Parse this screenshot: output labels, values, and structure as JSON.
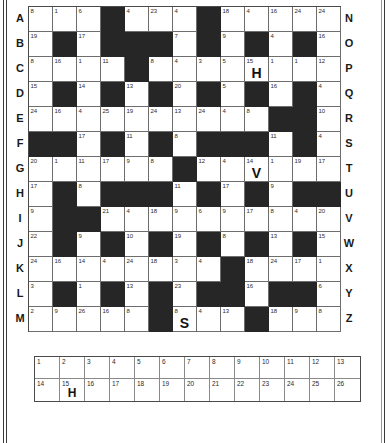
{
  "puzzle": {
    "type": "codeword",
    "grid_columns": 13,
    "grid_rows": 13,
    "row_labels_left": [
      "A",
      "B",
      "C",
      "D",
      "E",
      "F",
      "G",
      "H",
      "I",
      "J",
      "K",
      "L",
      "M"
    ],
    "row_labels_right": [
      "N",
      "O",
      "P",
      "Q",
      "R",
      "S",
      "T",
      "U",
      "V",
      "W",
      "X",
      "Y",
      "Z"
    ],
    "rows": [
      [
        {
          "n": "8"
        },
        {
          "n": "1"
        },
        {
          "n": "6"
        },
        {
          "black": true
        },
        {
          "n": "4"
        },
        {
          "n": "23"
        },
        {
          "n": "4"
        },
        {
          "black": true
        },
        {
          "n": "18"
        },
        {
          "n": "4"
        },
        {
          "n": "16"
        },
        {
          "n": "24"
        },
        {
          "n": "24"
        }
      ],
      [
        {
          "n": "19"
        },
        {
          "black": true
        },
        {
          "n": "17"
        },
        {
          "black": true
        },
        {
          "black": true
        },
        {
          "black": true
        },
        {
          "n": "7"
        },
        {
          "black": true
        },
        {
          "n": "9"
        },
        {
          "black": true
        },
        {
          "n": "4"
        },
        {
          "black": true
        },
        {
          "n": "16"
        }
      ],
      [
        {
          "n": "8"
        },
        {
          "n": "16"
        },
        {
          "n": "1"
        },
        {
          "n": "11"
        },
        {
          "black": true
        },
        {
          "n": "8"
        },
        {
          "n": "4"
        },
        {
          "n": "3"
        },
        {
          "n": "5"
        },
        {
          "n": "15",
          "letter": "H"
        },
        {
          "n": "1"
        },
        {
          "n": "1"
        },
        {
          "n": "12"
        }
      ],
      [
        {
          "n": "15"
        },
        {
          "black": true
        },
        {
          "n": "14"
        },
        {
          "black": true
        },
        {
          "n": "13"
        },
        {
          "black": true
        },
        {
          "n": "20"
        },
        {
          "black": true
        },
        {
          "n": "5"
        },
        {
          "black": true
        },
        {
          "n": "16"
        },
        {
          "black": true
        },
        {
          "n": "4"
        }
      ],
      [
        {
          "n": "24"
        },
        {
          "n": "16"
        },
        {
          "n": "4"
        },
        {
          "n": "25"
        },
        {
          "n": "19"
        },
        {
          "n": "24"
        },
        {
          "n": "13"
        },
        {
          "n": "24"
        },
        {
          "n": "4"
        },
        {
          "n": "8"
        },
        {
          "black": true
        },
        {
          "black": true
        },
        {
          "n": "10"
        }
      ],
      [
        {
          "black": true
        },
        {
          "black": true
        },
        {
          "n": "17"
        },
        {
          "black": true
        },
        {
          "n": "11"
        },
        {
          "black": true
        },
        {
          "n": "8"
        },
        {
          "black": true
        },
        {
          "black": true
        },
        {
          "black": true
        },
        {
          "n": "11"
        },
        {
          "black": true
        },
        {
          "n": "4"
        }
      ],
      [
        {
          "n": "20"
        },
        {
          "n": "1"
        },
        {
          "n": "11"
        },
        {
          "n": "17"
        },
        {
          "n": "9"
        },
        {
          "n": "8"
        },
        {
          "black": true
        },
        {
          "n": "12"
        },
        {
          "n": "4"
        },
        {
          "n": "14",
          "letter": "V"
        },
        {
          "n": "1"
        },
        {
          "n": "19"
        },
        {
          "n": "17"
        }
      ],
      [
        {
          "n": "17"
        },
        {
          "black": true
        },
        {
          "n": "8"
        },
        {
          "black": true
        },
        {
          "black": true
        },
        {
          "black": true
        },
        {
          "n": "11"
        },
        {
          "black": true
        },
        {
          "n": "17"
        },
        {
          "black": true
        },
        {
          "n": "9"
        },
        {
          "black": true
        },
        {
          "black": true
        }
      ],
      [
        {
          "n": "9"
        },
        {
          "black": true
        },
        {
          "black": true
        },
        {
          "n": "21"
        },
        {
          "n": "4"
        },
        {
          "n": "18"
        },
        {
          "n": "9"
        },
        {
          "n": "6"
        },
        {
          "n": "9"
        },
        {
          "n": "17"
        },
        {
          "n": "8"
        },
        {
          "n": "4"
        },
        {
          "n": "20"
        }
      ],
      [
        {
          "n": "22"
        },
        {
          "black": true
        },
        {
          "n": "9"
        },
        {
          "black": true
        },
        {
          "n": "10"
        },
        {
          "black": true
        },
        {
          "n": "19"
        },
        {
          "black": true
        },
        {
          "n": "8"
        },
        {
          "black": true
        },
        {
          "n": "13"
        },
        {
          "black": true
        },
        {
          "n": "15"
        }
      ],
      [
        {
          "n": "24"
        },
        {
          "n": "16"
        },
        {
          "n": "14"
        },
        {
          "n": "4"
        },
        {
          "n": "24"
        },
        {
          "n": "18"
        },
        {
          "n": "3"
        },
        {
          "n": "4"
        },
        {
          "black": true
        },
        {
          "n": "18"
        },
        {
          "n": "24"
        },
        {
          "n": "17"
        },
        {
          "n": "1"
        }
      ],
      [
        {
          "n": "3"
        },
        {
          "black": true
        },
        {
          "n": "1"
        },
        {
          "black": true
        },
        {
          "n": "13"
        },
        {
          "black": true
        },
        {
          "n": "23"
        },
        {
          "black": true
        },
        {
          "black": true
        },
        {
          "n": "16"
        },
        {
          "black": true
        },
        {
          "black": true
        },
        {
          "n": "6"
        }
      ],
      [
        {
          "n": "2"
        },
        {
          "n": "9"
        },
        {
          "n": "26"
        },
        {
          "n": "16"
        },
        {
          "n": "8"
        },
        {
          "black": true
        },
        {
          "n": "8",
          "letter": "S"
        },
        {
          "n": "4"
        },
        {
          "n": "13"
        },
        {
          "black": true
        },
        {
          "n": "18"
        },
        {
          "n": "9"
        },
        {
          "n": "8"
        }
      ]
    ]
  },
  "letter_bank": {
    "rows": [
      [
        {
          "n": "1",
          "letter": ""
        },
        {
          "n": "2",
          "letter": ""
        },
        {
          "n": "3",
          "letter": ""
        },
        {
          "n": "4",
          "letter": ""
        },
        {
          "n": "5",
          "letter": ""
        },
        {
          "n": "6",
          "letter": ""
        },
        {
          "n": "7",
          "letter": ""
        },
        {
          "n": "8",
          "letter": ""
        },
        {
          "n": "9",
          "letter": ""
        },
        {
          "n": "10",
          "letter": ""
        },
        {
          "n": "11",
          "letter": ""
        },
        {
          "n": "12",
          "letter": ""
        },
        {
          "n": "13",
          "letter": ""
        }
      ],
      [
        {
          "n": "14",
          "letter": ""
        },
        {
          "n": "15",
          "letter": "H"
        },
        {
          "n": "16",
          "letter": ""
        },
        {
          "n": "17",
          "letter": ""
        },
        {
          "n": "18",
          "letter": ""
        },
        {
          "n": "19",
          "letter": ""
        },
        {
          "n": "20",
          "letter": ""
        },
        {
          "n": "21",
          "letter": ""
        },
        {
          "n": "22",
          "letter": ""
        },
        {
          "n": "23",
          "letter": ""
        },
        {
          "n": "24",
          "letter": ""
        },
        {
          "n": "25",
          "letter": ""
        },
        {
          "n": "26",
          "letter": ""
        }
      ]
    ]
  },
  "colors": {
    "black_cell": "#262626",
    "white_cell": "#ffffff",
    "grid_line": "#6d6d6d",
    "border": "#4a4a4a",
    "text": "#1a1a1a"
  }
}
